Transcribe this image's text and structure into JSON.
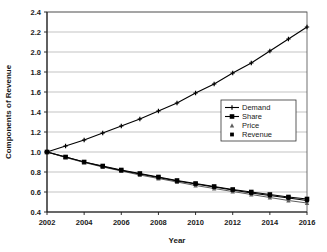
{
  "chart_data": {
    "type": "line",
    "title": "",
    "xlabel": "Year",
    "ylabel": "Components of Revenue",
    "xlim": [
      2002,
      2016
    ],
    "ylim": [
      0.4,
      2.4
    ],
    "yticks": [
      "0.4",
      "0.6",
      "0.8",
      "1.0",
      "1.2",
      "1.4",
      "1.6",
      "1.8",
      "2.0",
      "2.2",
      "2.4"
    ],
    "ytick_values": [
      0.4,
      0.6,
      0.8,
      1.0,
      1.2,
      1.4,
      1.6,
      1.8,
      2.0,
      2.2,
      2.4
    ],
    "xticks": [
      "2002",
      "2004",
      "2006",
      "2008",
      "2010",
      "2012",
      "2014",
      "2016"
    ],
    "xtick_values": [
      2002,
      2004,
      2006,
      2008,
      2010,
      2012,
      2014,
      2016
    ],
    "x": [
      2002,
      2003,
      2004,
      2005,
      2006,
      2007,
      2008,
      2009,
      2010,
      2011,
      2012,
      2013,
      2014,
      2015,
      2016
    ],
    "grid": "horizontal",
    "legend_position": "center-right",
    "series": [
      {
        "name": "Demand",
        "marker": "cross",
        "color": "#000000",
        "values": [
          1.0,
          1.06,
          1.12,
          1.19,
          1.26,
          1.33,
          1.41,
          1.49,
          1.59,
          1.68,
          1.79,
          1.89,
          2.01,
          2.13,
          2.25
        ]
      },
      {
        "name": "Share",
        "marker": "square",
        "color": "#000000",
        "values": [
          1.0,
          0.95,
          0.9,
          0.86,
          0.82,
          0.785,
          0.75,
          0.715,
          0.685,
          0.655,
          0.625,
          0.6,
          0.575,
          0.55,
          0.53
        ]
      },
      {
        "name": "Price",
        "marker": "triangle",
        "color": "#5e5e5e",
        "values": [
          1.0,
          0.945,
          0.895,
          0.85,
          0.81,
          0.77,
          0.735,
          0.7,
          0.665,
          0.635,
          0.605,
          0.575,
          0.545,
          0.515,
          0.49
        ]
      },
      {
        "name": "Revenue",
        "marker": "square-small",
        "color": "#000000",
        "values": [
          1.0,
          0.95,
          0.9,
          0.855,
          0.815,
          0.78,
          0.745,
          0.71,
          0.68,
          0.65,
          0.62,
          0.59,
          0.565,
          0.54,
          0.515
        ]
      }
    ]
  },
  "legend": {
    "entries": [
      {
        "label": "Demand"
      },
      {
        "label": "Share"
      },
      {
        "label": "Price"
      },
      {
        "label": "Revenue"
      }
    ]
  }
}
